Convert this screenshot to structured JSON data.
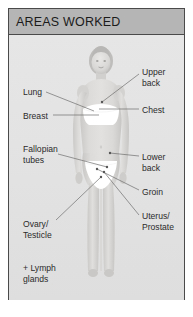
{
  "panel": {
    "title": "AREAS WORKED",
    "accent_color": "#b5b5b5",
    "border_color": "#4a4a4a",
    "background_color": "#e4e4e4",
    "text_color": "#2b2b2b"
  },
  "figure": {
    "skin_color": "#d8d6d4",
    "underwear_color": "#ffffff"
  },
  "labels": {
    "left": [
      {
        "id": "lung",
        "text": "Lung",
        "x": 14,
        "y": 52
      },
      {
        "id": "breast",
        "text": "Breast",
        "x": 14,
        "y": 76
      },
      {
        "id": "fallopian-tubes",
        "text": "Fallopian\ntubes",
        "x": 14,
        "y": 109
      },
      {
        "id": "ovary-testicle",
        "text": "Ovary/\nTesticle",
        "x": 14,
        "y": 184
      },
      {
        "id": "lymph-glands",
        "text": "+ Lymph\nglands",
        "x": 14,
        "y": 228
      }
    ],
    "right": [
      {
        "id": "upper-back",
        "text": "Upper\nback",
        "x": 133,
        "y": 32
      },
      {
        "id": "chest",
        "text": "Chest",
        "x": 133,
        "y": 70
      },
      {
        "id": "lower-back",
        "text": "Lower\nback",
        "x": 133,
        "y": 117
      },
      {
        "id": "groin",
        "text": "Groin",
        "x": 133,
        "y": 152
      },
      {
        "id": "uterus-prostate",
        "text": "Uterus/\nProstate",
        "x": 133,
        "y": 176
      }
    ]
  },
  "leader_lines": {
    "color": "#6e6e6e",
    "dot_color": "#555555",
    "items": [
      {
        "id": "lung-line",
        "from": [
          37,
          57
        ],
        "to": [
          85,
          76
        ]
      },
      {
        "id": "breast-line",
        "from": [
          44,
          80
        ],
        "to": [
          90,
          80
        ]
      },
      {
        "id": "fallopian-tubes-line",
        "from": [
          49,
          119
        ],
        "to": [
          98,
          132
        ]
      },
      {
        "id": "ovary-testicle-line",
        "from": [
          47,
          185
        ],
        "to": [
          92,
          142
        ]
      },
      {
        "id": "upper-back-line",
        "from": [
          130,
          39
        ],
        "to": [
          93,
          67
        ]
      },
      {
        "id": "chest-line",
        "from": [
          130,
          74
        ],
        "to": [
          90,
          74
        ]
      },
      {
        "id": "lower-back-line",
        "from": [
          130,
          121
        ],
        "to": [
          101,
          118
        ]
      },
      {
        "id": "groin-line",
        "from": [
          130,
          155
        ],
        "to": [
          88,
          134
        ]
      },
      {
        "id": "uterus-prostate-line",
        "from": [
          130,
          180
        ],
        "to": [
          95,
          137
        ]
      }
    ]
  }
}
